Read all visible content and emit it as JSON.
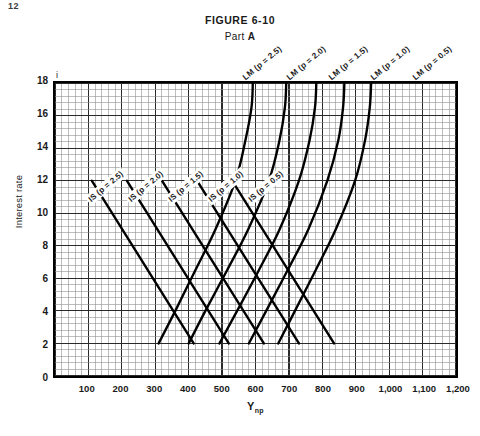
{
  "page_corner": "12",
  "figure": {
    "title": "FIGURE 6-10",
    "part_prefix": "Part ",
    "part_letter": "A"
  },
  "axes": {
    "y_title": "Interest rate",
    "y_symbol": "i",
    "x_title_main": "Y",
    "x_title_sub": "np",
    "y_ticks": [
      "18",
      "16",
      "14",
      "12",
      "10",
      "8",
      "6",
      "4",
      "2",
      "0"
    ],
    "x_ticks": [
      "100",
      "200",
      "300",
      "400",
      "500",
      "600",
      "700",
      "800",
      "900",
      "1,000",
      "1,100",
      "1,200"
    ]
  },
  "labels": {
    "lm": [
      "LM (p = 2.5)",
      "LM (p = 2.0)",
      "LM (p = 1.5)",
      "LM (p = 1.0)",
      "LM (p = 0.5)"
    ],
    "is": [
      "IS (p = 2.5)",
      "IS (p = 2.0)",
      "IS (p = 1.5)",
      "IS (p = 1.0)",
      "IS (p = 0.5)"
    ]
  },
  "colors": {
    "curve": "#000000",
    "grid_major": "#2a2a2a",
    "grid_minor": "#8f8f8f",
    "frame": "#000000",
    "background": "#ffffff"
  },
  "chart_data": {
    "type": "line",
    "xlabel": "Y_np",
    "ylabel": "Interest rate (i)",
    "xlim": [
      0,
      1200
    ],
    "ylim": [
      0,
      18
    ],
    "grid": true,
    "legend": "inline-curve-labels",
    "x_ticks": [
      100,
      200,
      300,
      400,
      500,
      600,
      700,
      800,
      900,
      1000,
      1100,
      1200
    ],
    "y_ticks": [
      0,
      2,
      4,
      6,
      8,
      10,
      12,
      14,
      16,
      18
    ],
    "series": [
      {
        "name": "IS (p = 2.5)",
        "kind": "IS",
        "p": 2.5,
        "shape": "straight-downward-sloping",
        "points": [
          [
            110,
            12.0
          ],
          [
            415,
            2.0
          ]
        ]
      },
      {
        "name": "IS (p = 2.0)",
        "kind": "IS",
        "p": 2.0,
        "shape": "straight-downward-sloping",
        "points": [
          [
            215,
            12.0
          ],
          [
            520,
            2.0
          ]
        ]
      },
      {
        "name": "IS (p = 1.5)",
        "kind": "IS",
        "p": 1.5,
        "shape": "straight-downward-sloping",
        "points": [
          [
            320,
            12.0
          ],
          [
            625,
            2.0
          ]
        ]
      },
      {
        "name": "IS (p = 1.0)",
        "kind": "IS",
        "p": 1.0,
        "shape": "straight-downward-sloping",
        "points": [
          [
            425,
            12.0
          ],
          [
            730,
            2.0
          ]
        ]
      },
      {
        "name": "IS (p = 0.5)",
        "kind": "IS",
        "p": 0.5,
        "shape": "straight-downward-sloping",
        "points": [
          [
            530,
            12.0
          ],
          [
            835,
            2.0
          ]
        ]
      },
      {
        "name": "LM (p = 2.5)",
        "kind": "LM",
        "p": 2.5,
        "shape": "upward-sloping-convex",
        "points": [
          [
            310,
            2.0
          ],
          [
            360,
            4.0
          ],
          [
            420,
            6.5
          ],
          [
            480,
            9.0
          ],
          [
            540,
            12.0
          ],
          [
            570,
            14.5
          ],
          [
            588,
            16.5
          ],
          [
            592,
            18.0
          ]
        ]
      },
      {
        "name": "LM (p = 2.0)",
        "kind": "LM",
        "p": 2.0,
        "shape": "upward-sloping-convex",
        "points": [
          [
            400,
            2.0
          ],
          [
            450,
            4.0
          ],
          [
            515,
            6.5
          ],
          [
            578,
            9.0
          ],
          [
            640,
            12.0
          ],
          [
            672,
            14.5
          ],
          [
            688,
            16.5
          ],
          [
            692,
            18.0
          ]
        ]
      },
      {
        "name": "LM (p = 1.5)",
        "kind": "LM",
        "p": 1.5,
        "shape": "upward-sloping-convex",
        "points": [
          [
            492,
            2.0
          ],
          [
            545,
            4.0
          ],
          [
            610,
            6.5
          ],
          [
            672,
            9.0
          ],
          [
            730,
            12.0
          ],
          [
            762,
            14.5
          ],
          [
            778,
            16.5
          ],
          [
            782,
            18.0
          ]
        ]
      },
      {
        "name": "LM (p = 1.0)",
        "kind": "LM",
        "p": 1.0,
        "shape": "upward-sloping-convex",
        "points": [
          [
            580,
            2.0
          ],
          [
            632,
            4.0
          ],
          [
            696,
            6.5
          ],
          [
            758,
            9.0
          ],
          [
            815,
            12.0
          ],
          [
            848,
            14.5
          ],
          [
            862,
            16.5
          ],
          [
            866,
            18.0
          ]
        ]
      },
      {
        "name": "LM (p = 0.5)",
        "kind": "LM",
        "p": 0.5,
        "shape": "upward-sloping-convex",
        "points": [
          [
            668,
            2.0
          ],
          [
            718,
            4.0
          ],
          [
            780,
            6.5
          ],
          [
            840,
            9.0
          ],
          [
            898,
            12.0
          ],
          [
            928,
            14.5
          ],
          [
            942,
            16.5
          ],
          [
            946,
            18.0
          ]
        ]
      }
    ]
  }
}
